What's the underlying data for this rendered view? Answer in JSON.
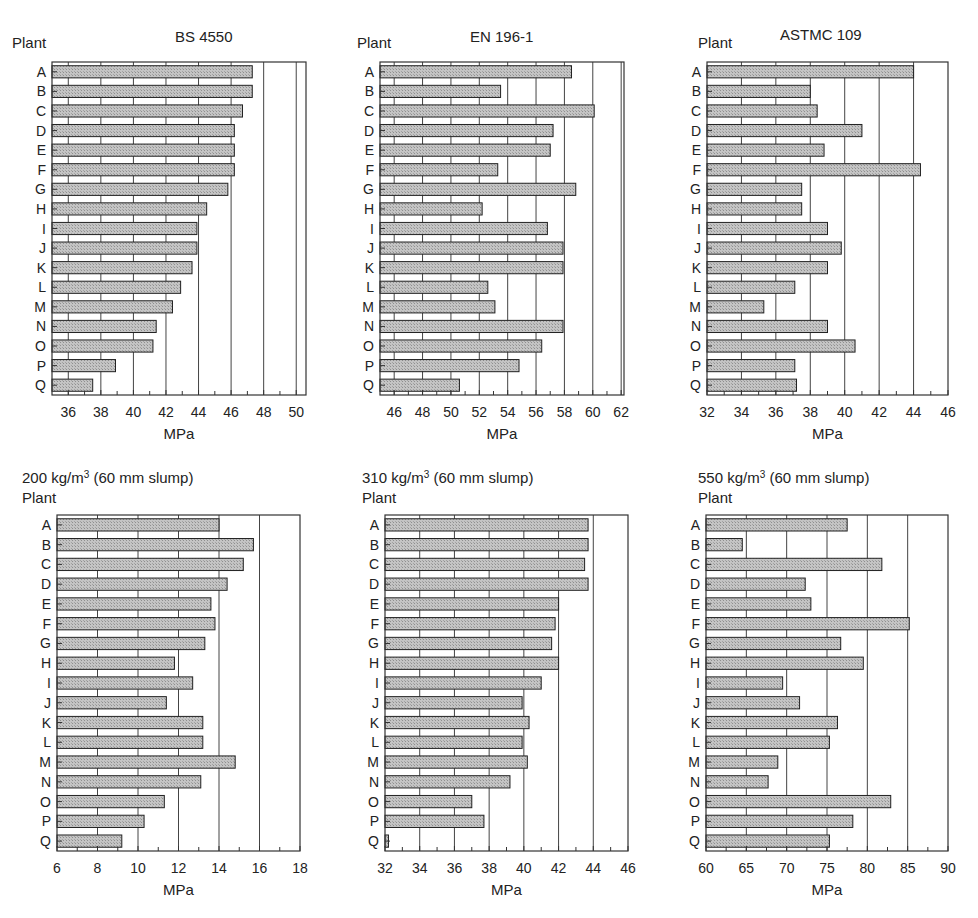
{
  "chart_data": [
    {
      "type": "bar",
      "orientation": "horizontal",
      "title": "BS 4550",
      "ylabel": "Plant",
      "xlabel": "MPa",
      "categories": [
        "A",
        "B",
        "C",
        "D",
        "E",
        "F",
        "G",
        "H",
        "I",
        "J",
        "K",
        "L",
        "M",
        "N",
        "O",
        "P",
        "Q"
      ],
      "values": [
        47.3,
        47.3,
        46.7,
        46.2,
        46.2,
        46.2,
        45.8,
        44.5,
        43.9,
        43.9,
        43.6,
        42.9,
        42.4,
        41.4,
        41.2,
        38.9,
        37.5
      ],
      "xlim": [
        35,
        50.6
      ],
      "xticks": [
        36,
        38,
        40,
        42,
        44,
        46,
        48,
        50
      ],
      "grid": "vertical"
    },
    {
      "type": "bar",
      "orientation": "horizontal",
      "title": "EN 196-1",
      "ylabel": "Plant",
      "xlabel": "MPa",
      "categories": [
        "A",
        "B",
        "C",
        "D",
        "E",
        "F",
        "G",
        "H",
        "I",
        "J",
        "K",
        "L",
        "M",
        "N",
        "O",
        "P",
        "Q"
      ],
      "values": [
        58.5,
        53.5,
        60.1,
        57.2,
        57.0,
        53.3,
        58.8,
        52.2,
        56.8,
        57.9,
        57.9,
        52.6,
        53.1,
        57.9,
        56.4,
        54.8,
        50.6
      ],
      "xlim": [
        45,
        62.2
      ],
      "xticks": [
        46,
        48,
        50,
        52,
        54,
        56,
        58,
        60,
        62
      ],
      "grid": "vertical"
    },
    {
      "type": "bar",
      "orientation": "horizontal",
      "title": "ASTMC 109",
      "ylabel": "Plant",
      "xlabel": "MPa",
      "categories": [
        "A",
        "B",
        "C",
        "D",
        "E",
        "F",
        "G",
        "H",
        "I",
        "J",
        "K",
        "L",
        "M",
        "N",
        "O",
        "P",
        "Q"
      ],
      "values": [
        44.0,
        38.0,
        38.4,
        41.0,
        38.8,
        44.4,
        37.5,
        37.5,
        39.0,
        39.8,
        39.0,
        37.1,
        35.3,
        39.0,
        40.6,
        37.1,
        37.2
      ],
      "xlim": [
        32,
        46
      ],
      "xticks": [
        32,
        34,
        36,
        38,
        40,
        42,
        44,
        46
      ],
      "grid": "vertical"
    },
    {
      "type": "bar",
      "orientation": "horizontal",
      "title": "200 kg/m",
      "title_sup": "3",
      "title_suffix": " (60 mm slump)",
      "ylabel": "Plant",
      "xlabel": "MPa",
      "categories": [
        "A",
        "B",
        "C",
        "D",
        "E",
        "F",
        "G",
        "H",
        "I",
        "J",
        "K",
        "L",
        "M",
        "N",
        "O",
        "P",
        "Q"
      ],
      "values": [
        14.0,
        15.7,
        15.2,
        14.4,
        13.6,
        13.8,
        13.3,
        11.8,
        12.7,
        11.4,
        13.2,
        13.2,
        14.8,
        13.1,
        11.3,
        10.3,
        9.2
      ],
      "xlim": [
        6,
        18
      ],
      "xticks": [
        6,
        8,
        10,
        12,
        14,
        16,
        18
      ],
      "grid": "vertical"
    },
    {
      "type": "bar",
      "orientation": "horizontal",
      "title": "310 kg/m",
      "title_sup": "3",
      "title_suffix": " (60 mm slump)",
      "ylabel": "Plant",
      "xlabel": "MPa",
      "categories": [
        "A",
        "B",
        "C",
        "D",
        "E",
        "F",
        "G",
        "H",
        "I",
        "J",
        "K",
        "L",
        "M",
        "N",
        "O",
        "P",
        "Q"
      ],
      "values": [
        43.7,
        43.7,
        43.5,
        43.7,
        42.0,
        41.8,
        41.6,
        42.0,
        41.0,
        39.9,
        40.3,
        39.9,
        40.2,
        39.2,
        37.0,
        37.7,
        32.2
      ],
      "xlim": [
        32,
        46
      ],
      "xticks": [
        32,
        34,
        36,
        38,
        40,
        42,
        44,
        46
      ],
      "grid": "vertical"
    },
    {
      "type": "bar",
      "orientation": "horizontal",
      "title": "550 kg/m",
      "title_sup": "3",
      "title_suffix": " (60 mm slump)",
      "ylabel": "Plant",
      "xlabel": "MPa",
      "categories": [
        "A",
        "B",
        "C",
        "D",
        "E",
        "F",
        "G",
        "H",
        "I",
        "J",
        "K",
        "L",
        "M",
        "N",
        "O",
        "P",
        "Q"
      ],
      "values": [
        77.5,
        64.5,
        81.8,
        72.3,
        73.0,
        85.2,
        76.7,
        79.5,
        69.5,
        71.6,
        76.3,
        75.3,
        68.9,
        67.7,
        82.9,
        78.2,
        75.3
      ],
      "xlim": [
        60,
        90
      ],
      "xticks": [
        60,
        65,
        70,
        75,
        80,
        85,
        90
      ],
      "grid": "vertical"
    }
  ],
  "colors": {
    "bar_fill": "#b9b9b9",
    "bar_outline": "#222222",
    "grid": "#444444"
  }
}
